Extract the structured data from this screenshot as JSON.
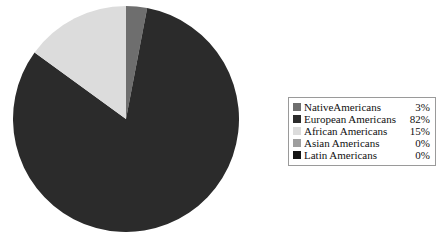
{
  "chart_data": {
    "type": "pie",
    "title": "",
    "categories": [
      "Native Americans",
      "European Americans",
      "African Americans",
      "Asian Americans",
      "Latin Americans"
    ],
    "values": [
      3,
      82,
      15,
      0,
      0
    ],
    "value_labels": [
      "3%",
      "82%",
      "15%",
      "0%",
      "0%"
    ],
    "units": "percent",
    "start_angle_deg": 0,
    "direction": "clockwise",
    "legend_position": "right",
    "grid": false,
    "slice_colors": [
      "#6e6e6e",
      "#2b2b2b",
      "#dcdcdc",
      "#9e9e9e",
      "#141414"
    ]
  },
  "legend": {
    "rows": [
      {
        "label": "NativeAmericans",
        "value": "3%",
        "color": "#6e6e6e"
      },
      {
        "label": "European Americans",
        "value": "82%",
        "color": "#2b2b2b"
      },
      {
        "label": "African Americans",
        "value": "15%",
        "color": "#dcdcdc"
      },
      {
        "label": "Asian Americans",
        "value": "0%",
        "color": "#9e9e9e"
      },
      {
        "label": "Latin Americans",
        "value": "0%",
        "color": "#141414"
      }
    ],
    "border_color": "#9a9a9a"
  },
  "pie": {
    "center_x": 113,
    "center_y": 113,
    "radius": 113,
    "slices": [
      {
        "name": "Native Americans",
        "percent": 3,
        "color": "#6e6e6e"
      },
      {
        "name": "European Americans",
        "percent": 82,
        "color": "#2b2b2b"
      },
      {
        "name": "African Americans",
        "percent": 15,
        "color": "#dcdcdc"
      },
      {
        "name": "Asian Americans",
        "percent": 0,
        "color": "#9e9e9e"
      },
      {
        "name": "Latin Americans",
        "percent": 0,
        "color": "#141414"
      }
    ]
  }
}
